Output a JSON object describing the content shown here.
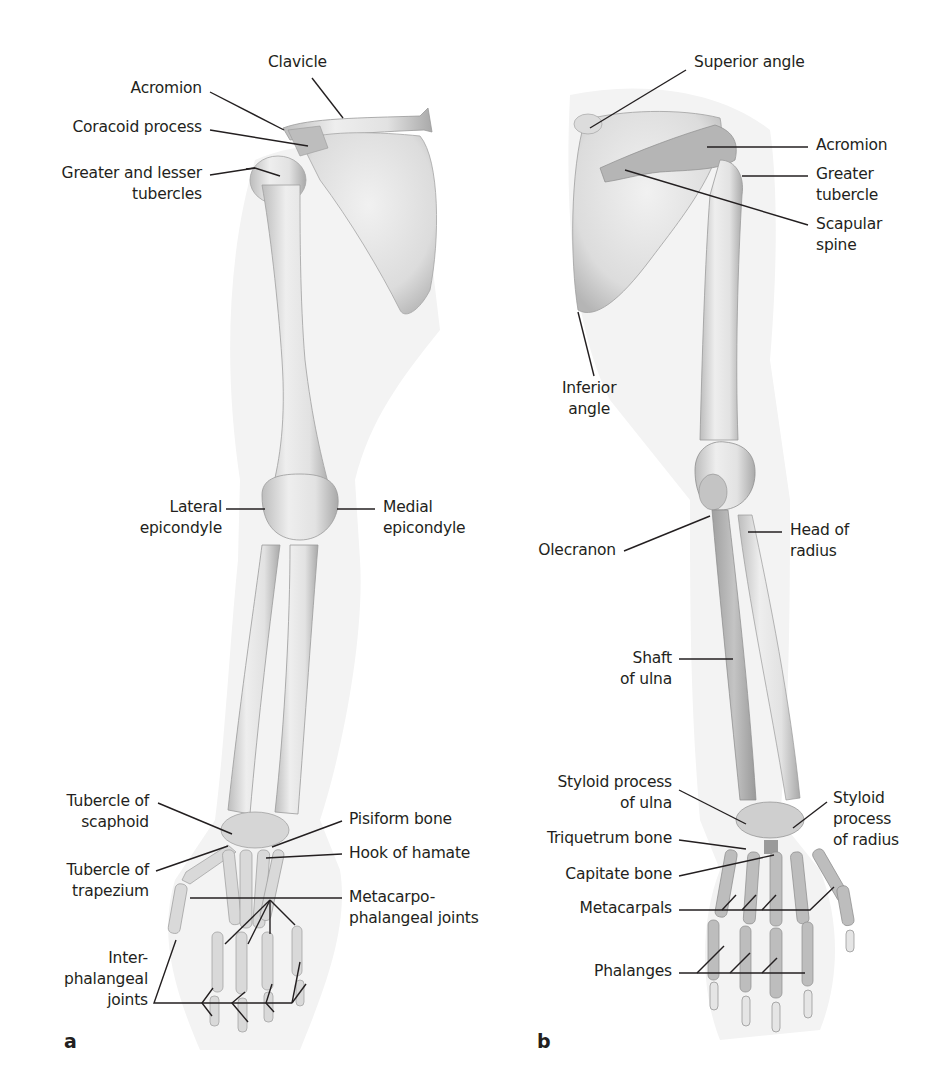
{
  "figure": {
    "panels": [
      {
        "id": "a",
        "letter": "a",
        "view": "anterior",
        "labels": {
          "clavicle": "Clavicle",
          "acromion": "Acromion",
          "coracoid_process": "Coracoid process",
          "tubercles_l1": "Greater and lesser",
          "tubercles_l2": "tubercles",
          "lateral_epicondyle_l1": "Lateral",
          "lateral_epicondyle_l2": "epicondyle",
          "medial_epicondyle_l1": "Medial",
          "medial_epicondyle_l2": "epicondyle",
          "tubercle_scaphoid_l1": "Tubercle of",
          "tubercle_scaphoid_l2": "scaphoid",
          "tubercle_trapezium_l1": "Tubercle of",
          "tubercle_trapezium_l2": "trapezium",
          "pisiform_bone": "Pisiform bone",
          "hook_of_hamate": "Hook of hamate",
          "mcp_joints_l1": "Metacarpo-",
          "mcp_joints_l2": "phalangeal joints",
          "ip_joints_l1": "Inter-",
          "ip_joints_l2": "phalangeal",
          "ip_joints_l3": "joints"
        }
      },
      {
        "id": "b",
        "letter": "b",
        "view": "posterior",
        "labels": {
          "superior_angle": "Superior angle",
          "acromion": "Acromion",
          "greater_tubercle_l1": "Greater",
          "greater_tubercle_l2": "tubercle",
          "scapular_spine_l1": "Scapular",
          "scapular_spine_l2": "spine",
          "inferior_angle_l1": "Inferior",
          "inferior_angle_l2": "angle",
          "olecranon": "Olecranon",
          "head_of_radius_l1": "Head of",
          "head_of_radius_l2": "radius",
          "shaft_of_ulna_l1": "Shaft",
          "shaft_of_ulna_l2": "of ulna",
          "styloid_ulna_l1": "Styloid process",
          "styloid_ulna_l2": "of ulna",
          "styloid_radius_l1": "Styloid",
          "styloid_radius_l2": "process",
          "styloid_radius_l3": "of radius",
          "triquetrum_bone": "Triquetrum bone",
          "capitate_bone": "Capitate bone",
          "metacarpals": "Metacarpals",
          "phalanges": "Phalanges"
        }
      }
    ],
    "colors": {
      "bone_light": "#e9e9e9",
      "bone_mid": "#cfcfcf",
      "bone_dark": "#9a9a9a",
      "soft_tissue": "#f2f2f2",
      "leader_line": "#231f20",
      "text": "#231f20"
    }
  }
}
